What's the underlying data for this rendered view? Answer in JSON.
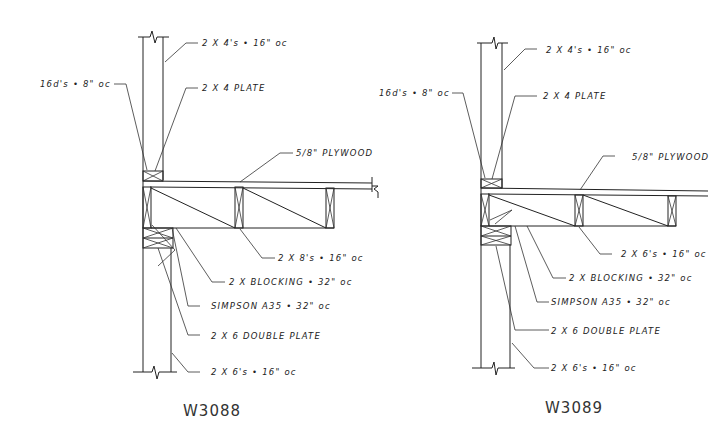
{
  "details": [
    {
      "id": "W3088",
      "title": "W3088",
      "labels": {
        "upper_studs": "2 X 4's • 16\" oc",
        "nails": "16d's • 8\" oc",
        "top_plate": "2 X 4 PLATE",
        "sheathing": "5/8\" PLYWOOD",
        "joists": "2 X 8's • 16\" oc",
        "blocking": "2 X BLOCKING • 32\" oc",
        "connector": "SIMPSON A35 • 32\" oc",
        "double_plate": "2 X 6 DOUBLE PLATE",
        "lower_studs": "2 X 6's • 16\" oc"
      }
    },
    {
      "id": "W3089",
      "title": "W3089",
      "labels": {
        "upper_studs": "2 X 4's • 16\" oc",
        "nails": "16d's • 8\" oc",
        "top_plate": "2 X 4 PLATE",
        "sheathing": "5/8\" PLYWOOD",
        "joists": "2 X 6's • 16\" oc",
        "blocking": "2 X BLOCKING • 32\" oc",
        "connector": "SIMPSON A35 • 32\" oc",
        "double_plate": "2 X 6 DOUBLE PLATE",
        "lower_studs": "2 X 6's • 16\" oc"
      }
    }
  ]
}
